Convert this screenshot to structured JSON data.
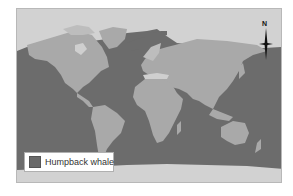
{
  "map": {
    "title": "Humpback whale distribution",
    "colors": {
      "range": "#6c6c6c",
      "land": "#a9a9a9",
      "outside_range": "#d2d2d2",
      "frame_border": "#b8b8b8"
    }
  },
  "legend": {
    "items": [
      {
        "label": "Humpback whale",
        "color": "#6a6a6a"
      }
    ]
  },
  "compass": {
    "label": "N",
    "icon": "north-arrow-icon"
  }
}
